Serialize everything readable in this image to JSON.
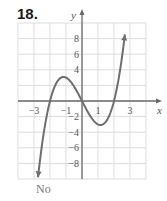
{
  "problem": {
    "number": "18.",
    "answer": "No"
  },
  "chart_data": {
    "type": "line",
    "title": "",
    "xlabel": "x",
    "ylabel": "y",
    "xlim": [
      -4,
      4
    ],
    "ylim": [
      -10,
      10
    ],
    "grid": true,
    "x_ticks": [
      "-3",
      "-1",
      "1",
      "3"
    ],
    "y_ticks": [
      "8",
      "6",
      "4",
      "-2",
      "-4",
      "-6",
      "-8"
    ],
    "series": [
      {
        "name": "curve",
        "description": "cubic, approx y = x^3 - 4x, arrows on both ends",
        "x": [
          -2.8,
          -2.5,
          -2,
          -1.5,
          -1.15,
          -0.5,
          0,
          0.5,
          1.15,
          1.5,
          2,
          2.5,
          2.7
        ],
        "y": [
          -10.8,
          -5.6,
          0,
          2.6,
          3.1,
          1.9,
          0,
          -1.9,
          -3.1,
          -2.6,
          0,
          5.6,
          8.9
        ]
      }
    ],
    "annotations": [
      "No"
    ]
  },
  "colors": {
    "grid": "#dcdcdc",
    "axis": "#6a6a6a",
    "curve": "#6e6e6e"
  }
}
